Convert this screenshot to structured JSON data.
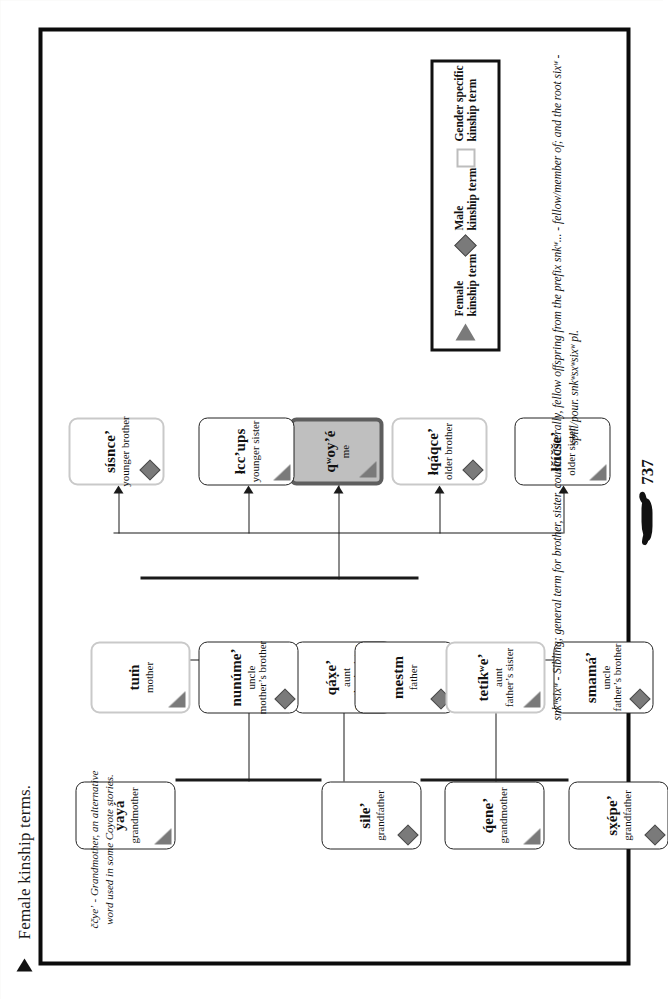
{
  "page": {
    "title": "Female kinship terms.",
    "number": "737",
    "coyote_glyph": "coyote-glyph"
  },
  "notes": {
    "coyote_note": "ččyeʼ - Grandmother, an alternative word used in some Coyote stories.",
    "footnote": "snkʷsixʷ - Sibling; general term for brother, sister, cousin.  Literally, fellow offspring from the prefix snkʷ... - fellow/member of; and the root sixʷ - spill/pour.  snkʷsxʷsixʷ pl."
  },
  "legend": {
    "items": [
      {
        "marker": "triangle",
        "line1": "Female",
        "line2": "kinship term"
      },
      {
        "marker": "diamond",
        "line1": "Male",
        "line2": "kinship term"
      },
      {
        "marker": "square",
        "line1": "Gender specific",
        "line2": "kinship term"
      }
    ]
  },
  "nodes": {
    "yaya": {
      "term": "yayá",
      "gloss": "grandmother",
      "gloss2": "",
      "marker": "triangle"
    },
    "sile": {
      "term": "sileʼ",
      "gloss": "grandfather",
      "gloss2": "",
      "marker": "diamond"
    },
    "qene": {
      "term": "q́eneʼ",
      "gloss": "grandmother",
      "gloss2": "",
      "marker": "triangle"
    },
    "sxepe": {
      "term": "sx̣épeʼ",
      "gloss": "grandfather",
      "gloss2": "",
      "marker": "diamond"
    },
    "qaxe": {
      "term": "qáx̣eʼ",
      "gloss": "aunt",
      "gloss2": "mother’s sister",
      "marker": "triangle"
    },
    "nunume": {
      "term": "nunúmeʼ",
      "gloss": "uncle",
      "gloss2": "mother’s brother",
      "marker": "diamond"
    },
    "tum": {
      "term": "tuṁ",
      "gloss": "mother",
      "gloss2": "",
      "marker": "triangle"
    },
    "mestm": {
      "term": "mestm",
      "gloss": "father",
      "gloss2": "",
      "marker": "diamond"
    },
    "tetikwe": {
      "term": "tetíkʷeʼ",
      "gloss": "aunt",
      "gloss2": "father’s sister",
      "marker": "triangle"
    },
    "smama": {
      "term": "smamáʼ",
      "gloss": "uncle",
      "gloss2": "father’s brother",
      "marker": "diamond"
    },
    "older_sister": {
      "term": "łčíčšeʼ",
      "gloss": "older sister",
      "gloss2": "",
      "marker": "triangle"
    },
    "older_brother": {
      "term": "łqáqceʼ",
      "gloss": "older brother",
      "gloss2": "",
      "marker": "diamond"
    },
    "me": {
      "term": "qʷoyʼé",
      "gloss": "me",
      "gloss2": "",
      "marker": "triangle"
    },
    "younger_sister": {
      "term": "łccʼups",
      "gloss": "younger sister",
      "gloss2": "",
      "marker": "triangle"
    },
    "younger_brother": {
      "term": "sísnceʼ",
      "gloss": "younger brother",
      "gloss2": "",
      "marker": "diamond"
    }
  },
  "colors": {
    "marker_fill": "#7a7a7a",
    "me_fill": "#bfbfbf",
    "me_border": "#5e5e5e",
    "frame": "#0b0b0b",
    "soft_border": "#c9c9c9"
  }
}
